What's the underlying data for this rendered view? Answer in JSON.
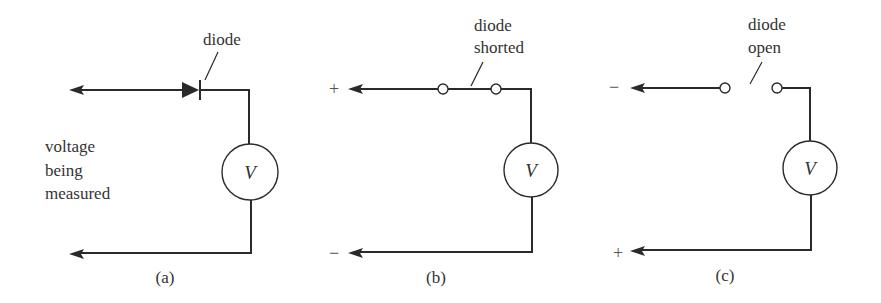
{
  "figure": {
    "panels": [
      {
        "id": "a",
        "caption": "(a)",
        "component_label": "diode",
        "side_label_lines": [
          "voltage",
          "being",
          "measured"
        ],
        "meter_label": "V",
        "top_sign": "",
        "bottom_sign": ""
      },
      {
        "id": "b",
        "caption": "(b)",
        "component_label_lines": [
          "diode",
          "shorted"
        ],
        "meter_label": "V",
        "top_sign": "+",
        "bottom_sign": "−"
      },
      {
        "id": "c",
        "caption": "(c)",
        "component_label_lines": [
          "diode",
          "open"
        ],
        "meter_label": "V",
        "top_sign": "−",
        "bottom_sign": "+"
      }
    ]
  },
  "colors": {
    "line": "#2a2a2a",
    "text": "#333333",
    "background": "#ffffff"
  }
}
